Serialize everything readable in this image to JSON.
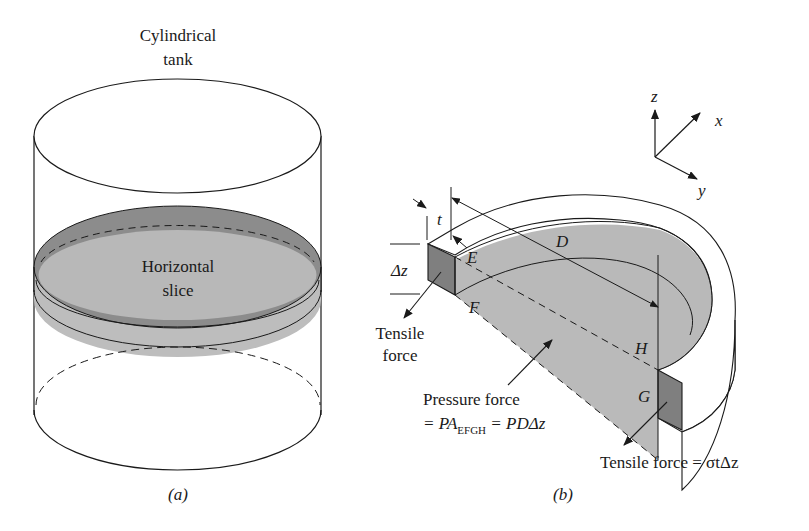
{
  "figure_a": {
    "title_line1": "Cylindrical",
    "title_line2": "tank",
    "slice_label_line1": "Horizontal",
    "slice_label_line2": "slice",
    "caption": "(a)"
  },
  "figure_b": {
    "axes": {
      "z": "z",
      "x": "x",
      "y": "y"
    },
    "thickness_label": "t",
    "diameter_label": "D",
    "height_label": "Δz",
    "points": {
      "E": "E",
      "F": "F",
      "G": "G",
      "H": "H"
    },
    "tensile_left_line1": "Tensile",
    "tensile_left_line2": "force",
    "pressure_line1": "Pressure force",
    "pressure_eq_prefix": "= PA",
    "pressure_eq_sub": "EFGH",
    "pressure_eq_suffix": " = PDΔz",
    "tensile_right": "Tensile force = σtΔz",
    "caption": "(b)"
  },
  "colors": {
    "line": "#1a1a1a",
    "slice_light": "#b9b9b9",
    "slice_dark": "#8a8a8a",
    "face_dark": "#7d7d7d",
    "background": "#ffffff"
  }
}
